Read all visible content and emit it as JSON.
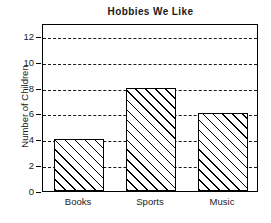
{
  "chart_data": {
    "type": "bar",
    "title": "Hobbies We Like",
    "xlabel": "",
    "ylabel": "Number of Children",
    "categories": [
      "Books",
      "Sports",
      "Music"
    ],
    "values": [
      4,
      8,
      6
    ],
    "ylim": [
      0,
      13
    ],
    "ytick_labels": [
      "0",
      "2",
      "4",
      "6",
      "8",
      "10",
      "12"
    ],
    "ytick_values": [
      0,
      2,
      4,
      6,
      8,
      10,
      12
    ],
    "gridlines": "horizontal-dashed",
    "grid": true,
    "legend": "none",
    "bar_fill": "diagonal-hatch",
    "bar_color": "#ffffff",
    "line_color": "#000000"
  }
}
